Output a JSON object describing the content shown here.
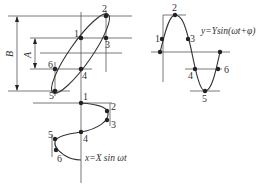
{
  "figure": {
    "dimensions": {
      "outer_label": "B",
      "inner_label": "A"
    },
    "equations": {
      "horizontal": "x=X sin ωt",
      "vertical": "y=Ysin(ωt+φ)"
    },
    "ellipse_points": [
      {
        "id": "1",
        "label": "1"
      },
      {
        "id": "2",
        "label": "2"
      },
      {
        "id": "3",
        "label": "3"
      },
      {
        "id": "4",
        "label": "4"
      },
      {
        "id": "5",
        "label": "5"
      },
      {
        "id": "6",
        "label": "6"
      }
    ],
    "right_sine_points": [
      {
        "label": "1"
      },
      {
        "label": "2"
      },
      {
        "label": "3"
      },
      {
        "label": "4"
      },
      {
        "label": "5"
      },
      {
        "label": "6"
      }
    ],
    "bottom_sine_points": [
      {
        "label": "1"
      },
      {
        "label": "2"
      },
      {
        "label": "3"
      },
      {
        "label": "4"
      },
      {
        "label": "5"
      },
      {
        "label": "6"
      }
    ],
    "colors": {
      "line": "#555555",
      "curve": "#333333",
      "point": "#222222",
      "background": "#ffffff"
    }
  }
}
